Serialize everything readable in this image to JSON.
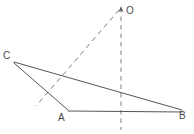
{
  "figure": {
    "background_color": "#ffffff",
    "stroke_color": "#55555a",
    "dashed_stroke_color": "#6a6a70",
    "label_color": "#4a4a4a",
    "width": 194,
    "height": 134,
    "points": [
      {
        "id": "O",
        "label": "O",
        "x": 121,
        "y": 8,
        "label_x": 126,
        "label_y": 6
      },
      {
        "id": "C",
        "label": "C",
        "x": 14,
        "y": 62,
        "label_x": 3,
        "label_y": 51
      },
      {
        "id": "A",
        "label": "A",
        "x": 68,
        "y": 110,
        "label_x": 58,
        "label_y": 113
      },
      {
        "id": "B",
        "label": "B",
        "x": 182,
        "y": 111,
        "label_x": 179,
        "label_y": 111
      }
    ],
    "solid_segments": [
      {
        "id": "CB",
        "from": "C",
        "to": "B",
        "x1": 14,
        "y1": 62,
        "x2": 182,
        "y2": 110
      },
      {
        "id": "CA",
        "from": "C",
        "to": "A",
        "x1": 14,
        "y1": 63,
        "x2": 68,
        "y2": 110
      },
      {
        "id": "AB",
        "from": "A",
        "to": "B",
        "x1": 68,
        "y1": 111,
        "x2": 182,
        "y2": 112
      }
    ],
    "dashed_segments": [
      {
        "id": "vertical-axis",
        "from": "O",
        "to": "below-baseline",
        "x1": 121,
        "y1": 8,
        "x2": 121,
        "y2": 130
      },
      {
        "id": "oblique-ray",
        "from": "O",
        "to": "lower-left",
        "x1": 119,
        "y1": 10,
        "x2": 36,
        "y2": 106
      }
    ],
    "intersections": [
      {
        "id": "oblique-meets-CB",
        "x": 63,
        "y": 73
      },
      {
        "id": "oblique-meets-CA",
        "x": 49,
        "y": 92
      },
      {
        "id": "vertical-meets-CB",
        "x": 121,
        "y": 92
      },
      {
        "id": "vertical-meets-AB",
        "x": 121,
        "y": 111
      }
    ],
    "arrow_marker": {
      "id": "apex-arrowhead",
      "x": 121,
      "y": 8,
      "direction": "up"
    }
  }
}
